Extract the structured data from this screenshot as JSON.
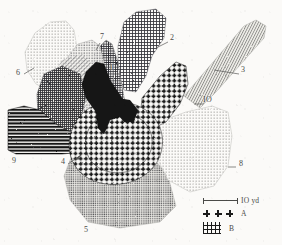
{
  "figure": {
    "kind": "scanned-plan-map",
    "background_color": "#fbfaf8",
    "ink_color": "#1b1b1b",
    "label_color": "#4a4a48"
  },
  "labels": [
    {
      "id": "1",
      "text": "1",
      "x": 110,
      "y": 68,
      "leader": null
    },
    {
      "id": "2",
      "text": "2",
      "x": 170,
      "y": 38,
      "leader": {
        "x1": 168,
        "y1": 42,
        "x2": 156,
        "y2": 48
      }
    },
    {
      "id": "3",
      "text": "3",
      "x": 241,
      "y": 70,
      "leader": {
        "x1": 239,
        "y1": 74,
        "x2": 214,
        "y2": 70
      }
    },
    {
      "id": "4",
      "text": "4",
      "x": 61,
      "y": 162,
      "leader": {
        "x1": 68,
        "y1": 164,
        "x2": 80,
        "y2": 156
      }
    },
    {
      "id": "5",
      "text": "5",
      "x": 84,
      "y": 228,
      "leader": null
    },
    {
      "id": "6",
      "text": "6",
      "x": 18,
      "y": 73,
      "leader": {
        "x1": 24,
        "y1": 74,
        "x2": 34,
        "y2": 68
      }
    },
    {
      "id": "7",
      "text": "7",
      "x": 101,
      "y": 37,
      "leader": {
        "x1": 100,
        "y1": 43,
        "x2": 96,
        "y2": 50
      }
    },
    {
      "id": "8",
      "text": "8",
      "x": 238,
      "y": 164,
      "leader": {
        "x1": 236,
        "y1": 167,
        "x2": 228,
        "y2": 167
      }
    },
    {
      "id": "9",
      "text": "9",
      "x": 13,
      "y": 160,
      "leader": null
    },
    {
      "id": "10",
      "text": "IO",
      "x": 204,
      "y": 100,
      "leader": {
        "x1": 203,
        "y1": 104,
        "x2": 194,
        "y2": 104
      }
    }
  ],
  "legend": {
    "scale": {
      "value": "IO yd",
      "bar_label": "IO yd"
    },
    "rows": [
      {
        "key": "A",
        "label": "A",
        "pattern": "plus-crosses"
      },
      {
        "key": "B",
        "label": "B",
        "pattern": "square-grid"
      }
    ]
  },
  "regions": [
    {
      "id": "1",
      "name": "central-dense-crosshatch-lobe",
      "fill": "fine-crosshatch-dark"
    },
    {
      "id": "2",
      "name": "upper-crosshatch-lobe",
      "fill": "medium-crosshatch"
    },
    {
      "id": "3",
      "name": "upper-right-striped-arm",
      "fill": "vertical-fine-lines"
    },
    {
      "id": "4",
      "name": "lower-left-ring-edge",
      "fill": "bold-plus-crosses"
    },
    {
      "id": "5",
      "name": "lower-stipple-lobe",
      "fill": "light-stipple"
    },
    {
      "id": "6",
      "name": "upper-left-stipple-lobe",
      "fill": "light-stipple"
    },
    {
      "id": "7",
      "name": "upper-left-dotted-lobe",
      "fill": "medium-stipple"
    },
    {
      "id": "8",
      "name": "right-stipple-lobe",
      "fill": "light-stipple"
    },
    {
      "id": "9",
      "name": "left-bold-horizontal-arm",
      "fill": "bold-horizontal-lines"
    },
    {
      "id": "10",
      "name": "right-plus-cross-lobe",
      "fill": "bold-plus-crosses"
    }
  ]
}
